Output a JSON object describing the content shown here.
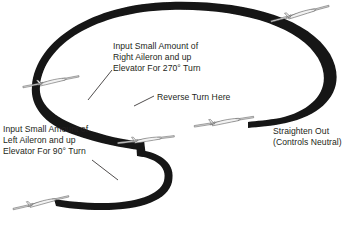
{
  "diagram": {
    "background_color": "#ffffff",
    "path_color": "#1a1a1a",
    "text_color": "#231f20",
    "annotations": {
      "right_turn": {
        "line1": "Input Small Amount of",
        "line2": "Right Aileron and up",
        "line3": "Elevator For 270° Turn"
      },
      "reverse": {
        "line1": "Reverse Turn Here"
      },
      "left_turn": {
        "line1": "Input Small Amount of",
        "line2": "Left Aileron and up",
        "line3": "Elevator For 90° Turn"
      },
      "straighten": {
        "line1": "Straighten Out",
        "line2": "(Controls Neutral)"
      }
    },
    "aircraft": [
      {
        "name": "airplane-top-right",
        "x": 300,
        "y": 14,
        "rotation": -12,
        "scale": 1.0
      },
      {
        "name": "airplane-left-upper",
        "x": 51,
        "y": 82,
        "rotation": -8,
        "scale": 0.95
      },
      {
        "name": "airplane-center-inflection",
        "x": 146,
        "y": 140,
        "rotation": -4,
        "scale": 0.95
      },
      {
        "name": "airplane-right-exit",
        "x": 224,
        "y": 122,
        "rotation": -6,
        "scale": 1.0
      },
      {
        "name": "airplane-bottom-left",
        "x": 41,
        "y": 203,
        "rotation": -10,
        "scale": 0.95
      }
    ]
  }
}
